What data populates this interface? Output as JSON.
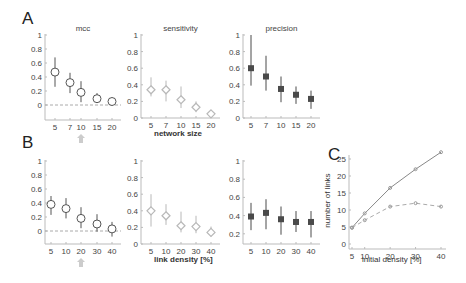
{
  "panel_labels": {
    "A": "A",
    "B": "B",
    "C": "C"
  },
  "xlabels": {
    "A": "network size",
    "B": "link density [%]",
    "C": "initial density [%]"
  },
  "ylabel_C": "number of links",
  "colors": {
    "mcc": "#555555",
    "sensitivity": "#b8b8b8",
    "precision": "#4a4a4a",
    "line_solid": "#888888",
    "line_dashed": "#aaaaaa",
    "arrow": "#cccccc"
  },
  "chart_data": [
    {
      "id": "A-mcc",
      "type": "scatter",
      "title": "mcc",
      "xlabel": "",
      "ylabel": "",
      "categories": [
        "5",
        "7",
        "10",
        "15",
        "20"
      ],
      "values": [
        0.47,
        0.32,
        0.18,
        0.09,
        0.05
      ],
      "err_low": [
        0.26,
        0.17,
        0.04,
        0.03,
        0.0
      ],
      "err_high": [
        0.68,
        0.46,
        0.34,
        0.17,
        0.1
      ],
      "yticks": [
        "0",
        "0.2",
        "0.4",
        "0.6",
        "0.8",
        "1"
      ],
      "ylim": [
        -0.2,
        1
      ],
      "reference_line": 0,
      "highlight_category": "10"
    },
    {
      "id": "A-sensitivity",
      "type": "scatter",
      "title": "sensitivity",
      "xlabel": "network size",
      "ylabel": "",
      "categories": [
        "5",
        "7",
        "10",
        "15",
        "20"
      ],
      "values": [
        0.34,
        0.34,
        0.22,
        0.13,
        0.05
      ],
      "err_low": [
        0.26,
        0.2,
        0.12,
        0.07,
        0.01
      ],
      "err_high": [
        0.49,
        0.45,
        0.38,
        0.2,
        0.09
      ],
      "yticks": [
        "0",
        "0.2",
        "0.4",
        "0.6",
        "0.8",
        "1"
      ],
      "ylim": [
        0,
        1
      ]
    },
    {
      "id": "A-precision",
      "type": "scatter",
      "title": "precision",
      "xlabel": "",
      "ylabel": "",
      "categories": [
        "5",
        "7",
        "10",
        "15",
        "20"
      ],
      "values": [
        0.6,
        0.5,
        0.35,
        0.28,
        0.23
      ],
      "err_low": [
        0.39,
        0.33,
        0.19,
        0.17,
        0.11
      ],
      "err_high": [
        1.0,
        0.75,
        0.5,
        0.38,
        0.33
      ],
      "yticks": [
        "0",
        "0.2",
        "0.4",
        "0.6",
        "0.8",
        "1"
      ],
      "ylim": [
        0,
        1
      ]
    },
    {
      "id": "B-mcc",
      "type": "scatter",
      "title": "",
      "xlabel": "",
      "ylabel": "",
      "categories": [
        "5",
        "10",
        "20",
        "30",
        "40"
      ],
      "values": [
        0.38,
        0.32,
        0.18,
        0.1,
        0.03
      ],
      "err_low": [
        0.23,
        0.18,
        0.04,
        -0.01,
        -0.08
      ],
      "err_high": [
        0.5,
        0.47,
        0.34,
        0.24,
        0.13
      ],
      "yticks": [
        "0",
        "0.2",
        "0.4",
        "0.6",
        "0.8",
        "1"
      ],
      "ylim": [
        -0.2,
        1
      ],
      "reference_line": 0,
      "highlight_category": "20"
    },
    {
      "id": "B-sensitivity",
      "type": "scatter",
      "title": "",
      "xlabel": "link density [%]",
      "ylabel": "",
      "categories": [
        "5",
        "10",
        "20",
        "30",
        "40"
      ],
      "values": [
        0.4,
        0.34,
        0.22,
        0.21,
        0.14
      ],
      "err_low": [
        0.21,
        0.23,
        0.14,
        0.13,
        0.09
      ],
      "err_high": [
        0.6,
        0.48,
        0.39,
        0.34,
        0.21
      ],
      "yticks": [
        "0",
        "0.2",
        "0.4",
        "0.6",
        "0.8",
        "1"
      ],
      "ylim": [
        0,
        1
      ]
    },
    {
      "id": "B-precision",
      "type": "scatter",
      "title": "",
      "xlabel": "",
      "ylabel": "",
      "categories": [
        "5",
        "10",
        "20",
        "30",
        "40"
      ],
      "values": [
        0.39,
        0.43,
        0.36,
        0.33,
        0.33
      ],
      "err_low": [
        0.24,
        0.25,
        0.19,
        0.22,
        0.16
      ],
      "err_high": [
        0.54,
        0.58,
        0.5,
        0.45,
        0.45
      ],
      "yticks": [
        "0.2",
        "0.4",
        "0.6",
        "0.8",
        "1"
      ],
      "ylim": [
        0.1,
        1
      ]
    },
    {
      "id": "C",
      "type": "line",
      "title": "",
      "xlabel": "initial density [%]",
      "ylabel": "number of links",
      "x": [
        5,
        10,
        20,
        30,
        40
      ],
      "series": [
        {
          "name": "solid",
          "values": [
            4.8,
            9,
            16.5,
            22,
            27
          ]
        },
        {
          "name": "dashed",
          "values": [
            4.8,
            7,
            11,
            12,
            11
          ]
        }
      ],
      "xticks": [
        "5",
        "10",
        "20",
        "30",
        "40"
      ],
      "yticks": [
        "0",
        "5",
        "10",
        "15",
        "20",
        "25"
      ],
      "ylim": [
        -1,
        27
      ]
    }
  ]
}
